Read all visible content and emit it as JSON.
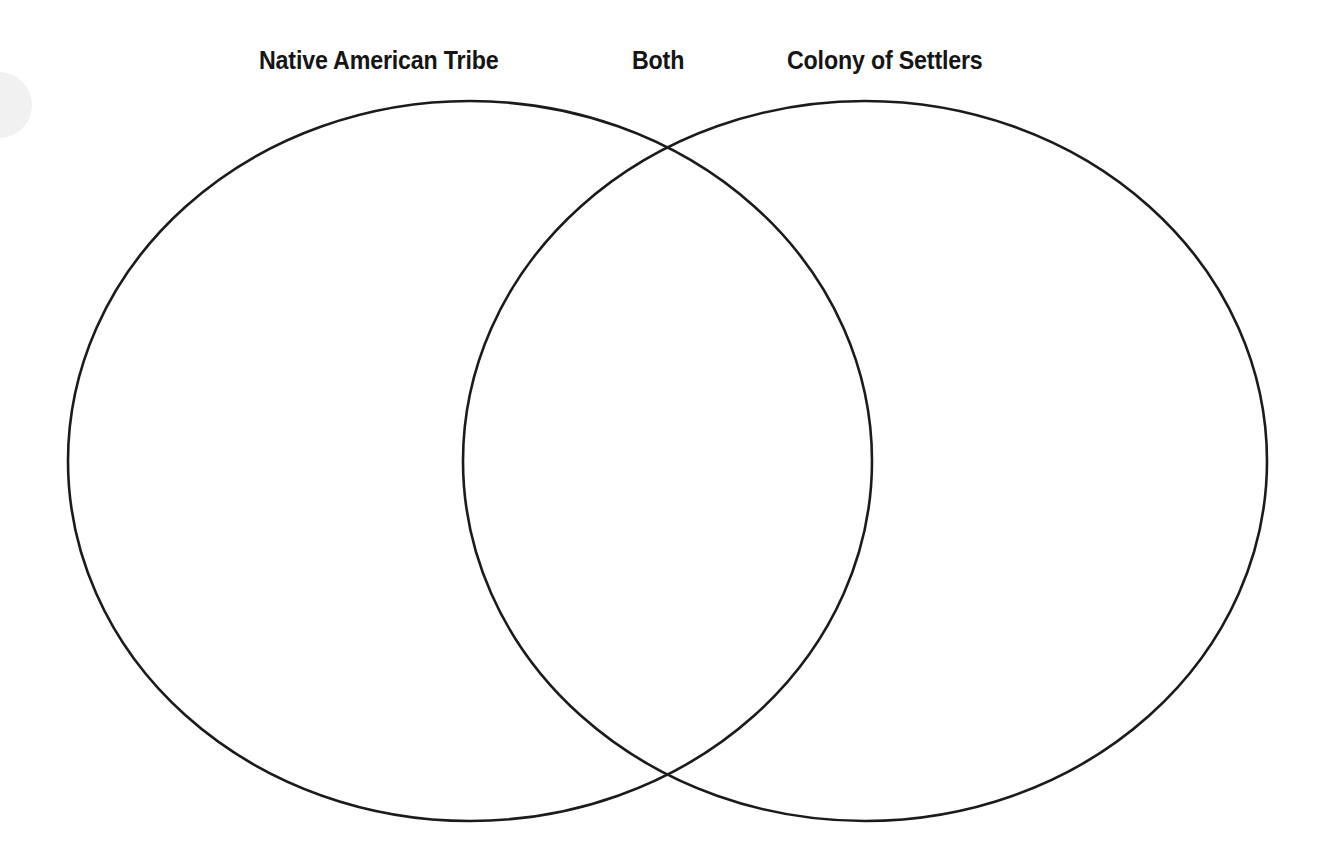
{
  "page": {
    "background_color": "#ffffff",
    "width": 1325,
    "height": 858
  },
  "diagram": {
    "type": "venn",
    "sets": 2,
    "stroke_color": "#1b1b1b",
    "stroke_width": 2.6,
    "fill_color": "none",
    "labels": {
      "left": "Native American Tribe",
      "center": "Both",
      "right": "Colony of Settlers"
    },
    "regions": [
      {
        "id": "left-only",
        "name": "Native American Tribe",
        "contents": []
      },
      {
        "id": "intersection",
        "name": "Both",
        "contents": []
      },
      {
        "id": "right-only",
        "name": "Colony of Settlers",
        "contents": []
      }
    ],
    "circles": [
      {
        "id": "left-circle",
        "label": "Native American Tribe",
        "cx": 470,
        "cy": 461,
        "rx": 402,
        "ry": 360
      },
      {
        "id": "right-circle",
        "label": "Colony of Settlers",
        "cx": 865,
        "cy": 461,
        "rx": 402,
        "ry": 360
      }
    ],
    "intersection_points": [
      {
        "x": 670,
        "y": 149
      },
      {
        "x": 670,
        "y": 778
      }
    ]
  }
}
